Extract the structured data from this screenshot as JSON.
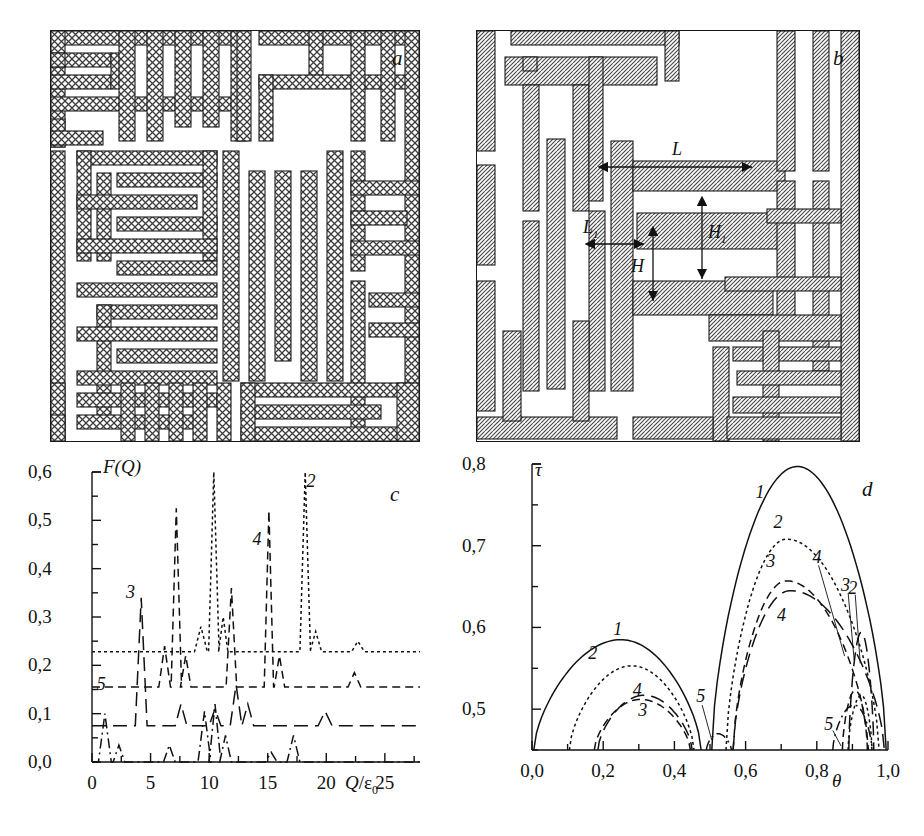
{
  "figure": {
    "panels": [
      {
        "id": "a",
        "letter": "a",
        "kind": "labyrinth-crosshatch"
      },
      {
        "id": "b",
        "letter": "b",
        "kind": "labyrinth-diagonal-hatch"
      },
      {
        "id": "c",
        "letter": "c",
        "kind": "chart"
      },
      {
        "id": "d",
        "letter": "d",
        "kind": "chart"
      }
    ]
  },
  "panel_b": {
    "dimensions": [
      {
        "name": "L",
        "label": "L",
        "orientation": "horizontal",
        "description": "long bar length"
      },
      {
        "name": "L1",
        "label": "L",
        "sub": "1",
        "orientation": "horizontal",
        "description": "short bar offset"
      },
      {
        "name": "H1",
        "label": "H",
        "sub": "1",
        "orientation": "vertical",
        "description": "large vertical gap"
      },
      {
        "name": "H",
        "label": "H",
        "orientation": "vertical",
        "description": "small vertical gap"
      }
    ]
  },
  "chart_data": [
    {
      "id": "c",
      "type": "line",
      "title": "",
      "panel_letter": "c",
      "xlabel": "Q/ε0",
      "ylabel": "F(Q)",
      "xlim": [
        0,
        28
      ],
      "ylim": [
        0.0,
        0.6
      ],
      "xticks": [
        0,
        5,
        10,
        15,
        20,
        25
      ],
      "xticklabels": [
        "0",
        "5",
        "10",
        "15",
        "20",
        "25"
      ],
      "yticks": [
        0.0,
        0.1,
        0.2,
        0.3,
        0.4,
        0.5,
        0.6
      ],
      "yticklabels": [
        "0,0",
        "0,1",
        "0,2",
        "0,3",
        "0,4",
        "0,5",
        "0,6"
      ],
      "minor_ticks": true,
      "grid": false,
      "legend": "inline-curve-numbers",
      "series": [
        {
          "name": "2",
          "label": "2",
          "dash": "dotted",
          "baseline": 0.228,
          "label_xy": [
            18.9,
            0.575
          ],
          "peaks": [
            {
              "x": 9.3,
              "y": 0.28,
              "w": 0.55
            },
            {
              "x": 10.4,
              "y": 0.6,
              "w": 0.45
            },
            {
              "x": 11.2,
              "y": 0.3,
              "w": 0.4
            },
            {
              "x": 18.2,
              "y": 0.6,
              "w": 0.45
            },
            {
              "x": 19.1,
              "y": 0.27,
              "w": 0.5
            },
            {
              "x": 22.7,
              "y": 0.25,
              "w": 0.55
            }
          ]
        },
        {
          "name": "4",
          "label": "4",
          "dash": "dashed",
          "baseline": 0.155,
          "label_xy": [
            14.3,
            0.455
          ],
          "peaks": [
            {
              "x": 6.2,
              "y": 0.24,
              "w": 0.5
            },
            {
              "x": 7.2,
              "y": 0.525,
              "w": 0.45
            },
            {
              "x": 8.0,
              "y": 0.22,
              "w": 0.45
            },
            {
              "x": 11.9,
              "y": 0.36,
              "w": 0.45
            },
            {
              "x": 15.1,
              "y": 0.52,
              "w": 0.4
            },
            {
              "x": 16.0,
              "y": 0.22,
              "w": 0.45
            },
            {
              "x": 22.4,
              "y": 0.185,
              "w": 0.55
            }
          ]
        },
        {
          "name": "3",
          "label": "3",
          "dash": "longdash",
          "baseline": 0.075,
          "label_xy": [
            3.5,
            0.345
          ],
          "peaks": [
            {
              "x": 4.2,
              "y": 0.34,
              "w": 0.5
            },
            {
              "x": 7.6,
              "y": 0.12,
              "w": 0.5
            },
            {
              "x": 10.5,
              "y": 0.11,
              "w": 0.5
            },
            {
              "x": 12.3,
              "y": 0.16,
              "w": 0.5
            },
            {
              "x": 13.3,
              "y": 0.12,
              "w": 0.5
            },
            {
              "x": 19.9,
              "y": 0.105,
              "w": 0.6
            }
          ]
        },
        {
          "name": "5",
          "label": "5",
          "dash": "dashdot",
          "baseline": 0.0,
          "label_xy": [
            1.0,
            0.155
          ],
          "peaks": [
            {
              "x": 1.1,
              "y": 0.1,
              "w": 0.55
            },
            {
              "x": 2.3,
              "y": 0.035,
              "w": 0.5
            },
            {
              "x": 6.6,
              "y": 0.035,
              "w": 0.5
            },
            {
              "x": 9.6,
              "y": 0.105,
              "w": 0.55
            },
            {
              "x": 10.5,
              "y": 0.12,
              "w": 0.5
            },
            {
              "x": 11.4,
              "y": 0.055,
              "w": 0.5
            },
            {
              "x": 15.3,
              "y": 0.02,
              "w": 0.5
            },
            {
              "x": 17.2,
              "y": 0.055,
              "w": 0.55
            }
          ]
        }
      ]
    },
    {
      "id": "d",
      "type": "line",
      "title": "",
      "panel_letter": "d",
      "xlabel": "θ",
      "ylabel": "τ",
      "xlim": [
        0.0,
        1.0
      ],
      "ylim": [
        0.45,
        0.8
      ],
      "xticks": [
        0.0,
        0.2,
        0.4,
        0.6,
        0.8,
        1.0
      ],
      "xticklabels": [
        "0,0",
        "0,2",
        "0,4",
        "0,6",
        "0,8",
        "1,0"
      ],
      "yticks": [
        0.5,
        0.6,
        0.7,
        0.8
      ],
      "yticklabels": [
        "0,5",
        "0,6",
        "0,7",
        "0,8"
      ],
      "minor_ticks": true,
      "grid": false,
      "legend": "inline-curve-numbers",
      "series": [
        {
          "name": "1",
          "label": "1",
          "dash": "solid",
          "labels": [
            {
              "text": "1",
              "xy": [
                0.245,
                0.595
              ]
            },
            {
              "text": "1",
              "xy": [
                0.645,
                0.762
              ]
            }
          ],
          "bands": [
            {
              "x0": 0.005,
              "x1": 0.475,
              "peak_x": 0.25,
              "peak_y": 0.585
            },
            {
              "x0": 0.505,
              "x1": 0.995,
              "peak_x": 0.745,
              "peak_y": 0.797
            }
          ]
        },
        {
          "name": "2",
          "label": "2",
          "dash": "dotted",
          "labels": [
            {
              "text": "2",
              "xy": [
                0.175,
                0.565
              ]
            },
            {
              "text": "2",
              "xy": [
                0.695,
                0.725
              ]
            },
            {
              "text": "2",
              "xy": [
                0.905,
                0.645
              ]
            }
          ],
          "bands": [
            {
              "x0": 0.105,
              "x1": 0.455,
              "peak_x": 0.28,
              "peak_y": 0.553
            },
            {
              "x0": 0.545,
              "x1": 0.975,
              "peak_x": 0.715,
              "peak_y": 0.708
            },
            {
              "x0": 0.888,
              "x1": 0.955,
              "peak_x": 0.925,
              "peak_y": 0.517
            }
          ]
        },
        {
          "name": "3",
          "label": "3",
          "dash": "dashed",
          "labels": [
            {
              "text": "3",
              "xy": [
                0.315,
                0.495
              ]
            },
            {
              "text": "3",
              "xy": [
                0.675,
                0.678
              ]
            },
            {
              "text": "3",
              "xy": [
                0.885,
                0.648
              ]
            }
          ],
          "bands": [
            {
              "x0": 0.175,
              "x1": 0.445,
              "peak_x": 0.305,
              "peak_y": 0.512
            },
            {
              "x0": 0.565,
              "x1": 0.945,
              "peak_x": 0.715,
              "peak_y": 0.657
            },
            {
              "x0": 0.872,
              "x1": 0.942,
              "peak_x": 0.908,
              "peak_y": 0.523
            }
          ]
        },
        {
          "name": "4",
          "label": "4",
          "dash": "longdash",
          "labels": [
            {
              "text": "4",
              "xy": [
                0.3,
                0.52
              ]
            },
            {
              "text": "4",
              "xy": [
                0.705,
                0.612
              ]
            },
            {
              "text": "4",
              "xy": [
                0.805,
                0.682
              ]
            }
          ],
          "bands": [
            {
              "x0": 0.185,
              "x1": 0.45,
              "peak_x": 0.315,
              "peak_y": 0.517
            },
            {
              "x0": 0.565,
              "x1": 0.99,
              "peak_x": 0.725,
              "peak_y": 0.645
            },
            {
              "x0": 0.89,
              "x1": 0.96,
              "peak_x": 0.925,
              "peak_y": 0.594
            }
          ]
        },
        {
          "name": "5",
          "label": "5",
          "dash": "dashdot",
          "labels": [
            {
              "text": "5",
              "xy": [
                0.478,
                0.513
              ]
            },
            {
              "text": "5",
              "xy": [
                0.838,
                0.478
              ]
            }
          ],
          "bands": [
            {
              "x0": 0.49,
              "x1": 0.56,
              "peak_x": 0.522,
              "peak_y": 0.47
            },
            {
              "x0": 0.845,
              "x1": 0.955,
              "peak_x": 0.905,
              "peak_y": 0.505
            }
          ]
        }
      ]
    }
  ]
}
